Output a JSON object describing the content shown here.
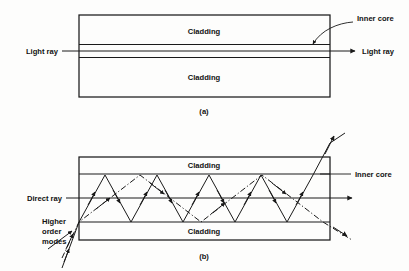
{
  "figure": {
    "title_a": "(a)",
    "title_b": "(b)",
    "panel_a": {
      "cladding_top_label": "Cladding",
      "cladding_bottom_label": "Cladding",
      "inner_core_label": "Inner core",
      "light_ray_in_label": "Light ray",
      "light_ray_out_label": "Light ray"
    },
    "panel_b": {
      "cladding_top_label": "Cladding",
      "cladding_bottom_label": "Cladding",
      "inner_core_label": "Inner core",
      "direct_ray_label": "Direct ray",
      "higher_order_modes_label_line1": "Higher",
      "higher_order_modes_label_line2": "order",
      "higher_order_modes_label_line3": "modes"
    }
  },
  "colors": {
    "ink": "#1a1a1a",
    "background": "#fdfdfc"
  }
}
